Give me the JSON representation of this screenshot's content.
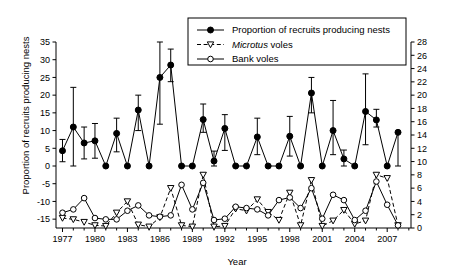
{
  "chart_data": {
    "type": "line",
    "title": "",
    "xlabel": "Year",
    "ylabel": "Proportion of recruits producing nests",
    "ylabel_right": "No. of voles per 100 trap nights",
    "xlim": [
      1976.4,
      2009.2
    ],
    "ylim": [
      -17.5,
      35
    ],
    "ylim_right": [
      0,
      28
    ],
    "yticks": [
      -15,
      -10,
      -5,
      0,
      5,
      10,
      15,
      20,
      25,
      30,
      35
    ],
    "yticks_right": [
      0,
      2,
      4,
      6,
      8,
      10,
      12,
      14,
      16,
      18,
      20,
      22,
      24,
      26,
      28
    ],
    "xticks": [
      1977,
      1980,
      1983,
      1986,
      1989,
      1992,
      1995,
      1998,
      2001,
      2004,
      2007
    ],
    "xtick_minor_step": 1,
    "grid": false,
    "legend_position": "top-center",
    "x": [
      1977,
      1978,
      1979,
      1980,
      1981,
      1982,
      1983,
      1984,
      1985,
      1986,
      1987,
      1988,
      1989,
      1990,
      1991,
      1992,
      1993,
      1994,
      1995,
      1996,
      1997,
      1998,
      1999,
      2000,
      2001,
      2002,
      2003,
      2004,
      2005,
      2006,
      2007,
      2008
    ],
    "series": [
      {
        "name": "Proportion of recruits producing nests",
        "axis": "left",
        "marker": "filled-circle",
        "line": "solid",
        "values": [
          4.3,
          11.0,
          6.5,
          7.1,
          0.0,
          9.2,
          0.0,
          15.8,
          0.0,
          25.0,
          28.5,
          0.0,
          0.0,
          13.1,
          1.4,
          10.6,
          0.0,
          0.0,
          8.2,
          0.0,
          0.0,
          8.4,
          0.0,
          20.6,
          0.0,
          10.0,
          2.0,
          0.0,
          15.4,
          13.0,
          0.0,
          9.5
        ],
        "err_lower": [
          1.2,
          0.0,
          2.0,
          2.2,
          0.0,
          4.0,
          0.0,
          10.0,
          0.0,
          11.8,
          23.8,
          0.0,
          0.0,
          9.5,
          0.0,
          4.4,
          0.0,
          0.0,
          3.2,
          0.0,
          0.0,
          2.8,
          0.0,
          15.0,
          0.0,
          3.2,
          0.0,
          0.0,
          6.0,
          11.0,
          0.0,
          0.0
        ],
        "err_upper": [
          7.5,
          22.2,
          11.0,
          12.0,
          0.0,
          13.5,
          0.0,
          20.0,
          0.0,
          35.0,
          33.0,
          0.0,
          0.0,
          17.5,
          4.2,
          14.5,
          0.0,
          0.0,
          13.5,
          0.0,
          0.0,
          14.0,
          0.0,
          25.0,
          0.0,
          18.5,
          4.5,
          0.0,
          26.0,
          16.0,
          0.0,
          9.5
        ]
      },
      {
        "name": "Microtus voles",
        "axis": "right",
        "marker": "open-triangle-down",
        "line": "dashed",
        "values": [
          1.5,
          1.3,
          0.9,
          0.4,
          0.3,
          2.3,
          4.0,
          0.5,
          0.2,
          1.6,
          6.0,
          0.4,
          0.2,
          8.0,
          0.2,
          0.3,
          2.9,
          2.6,
          4.3,
          2.4,
          1.2,
          5.3,
          0.4,
          7.2,
          0.3,
          1.1,
          2.7,
          0.6,
          1.1,
          8.0,
          7.5,
          0.4
        ]
      },
      {
        "name": "Bank voles",
        "axis": "right",
        "marker": "open-circle",
        "line": "solid",
        "values": [
          2.3,
          2.8,
          4.5,
          1.5,
          1.3,
          1.3,
          2.6,
          3.4,
          1.9,
          1.7,
          1.9,
          6.5,
          2.8,
          6.8,
          1.2,
          1.4,
          3.2,
          3.0,
          2.8,
          1.9,
          4.2,
          4.6,
          3.0,
          6.0,
          1.4,
          5.0,
          4.2,
          1.2,
          2.6,
          7.0,
          3.5,
          0.4
        ]
      }
    ]
  },
  "legend": {
    "items": [
      {
        "label": "Proportion of recruits producing nests",
        "marker": "filled-circle",
        "line": "solid"
      },
      {
        "label_italic": "Microtus",
        "label": " voles",
        "marker": "open-triangle-down",
        "line": "dashed"
      },
      {
        "label": "Bank voles",
        "marker": "open-circle",
        "line": "solid"
      }
    ]
  },
  "colors": {
    "ink": "#000000",
    "background": "#ffffff"
  }
}
